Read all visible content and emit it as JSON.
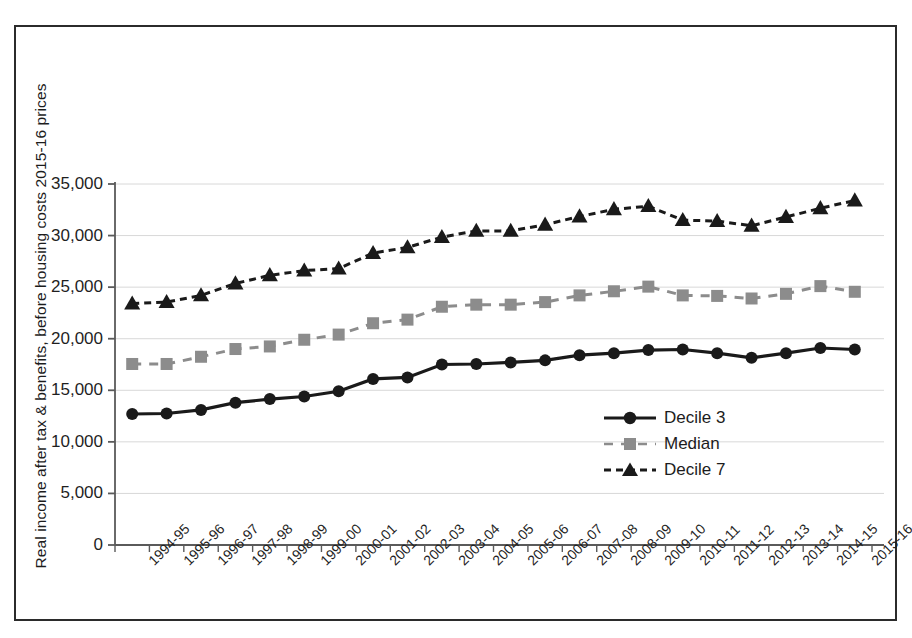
{
  "chart_data": {
    "type": "line",
    "title": "",
    "xlabel": "",
    "ylabel": "Real income after tax & benefits, before housing costs 2015-16 prices",
    "ylim": [
      0,
      35000
    ],
    "ytick_step": 5000,
    "grid": true,
    "legend_position": "inside-lower-right",
    "categories": [
      "1994-95",
      "1995-96",
      "1996-97",
      "1997-98",
      "1998-99",
      "1999-00",
      "2000-01",
      "2001-02",
      "2002-03",
      "2003-04",
      "2004-05",
      "2005-06",
      "2006-07",
      "2007-08",
      "2008-09",
      "2009-10",
      "2010-11",
      "2011-12",
      "2012-13",
      "2013-14",
      "2014-15",
      "2015-16"
    ],
    "ytick_labels": [
      "0",
      "5,000",
      "10,000",
      "15,000",
      "20,000",
      "25,000",
      "30,000",
      "35,000"
    ],
    "ytick_values": [
      0,
      5000,
      10000,
      15000,
      20000,
      25000,
      30000,
      35000
    ],
    "series": [
      {
        "name": "Decile 3",
        "marker": "circle",
        "line_style": "solid",
        "color": "#1a1a1a",
        "values": [
          12700,
          12750,
          13100,
          13800,
          14150,
          14400,
          14900,
          16100,
          16250,
          17500,
          17550,
          17700,
          17900,
          18400,
          18600,
          18900,
          18950,
          18600,
          18150,
          18600,
          19100,
          18950
        ]
      },
      {
        "name": "Median",
        "marker": "square",
        "line_style": "dashed",
        "color": "#8c8c8c",
        "values": [
          17550,
          17550,
          18250,
          19000,
          19250,
          19900,
          20400,
          21500,
          21850,
          23100,
          23300,
          23300,
          23550,
          24200,
          24600,
          25050,
          24200,
          24150,
          23900,
          24350,
          25100,
          24550
        ]
      },
      {
        "name": "Decile 7",
        "marker": "triangle",
        "line_style": "dashed",
        "color": "#1a1a1a",
        "values": [
          23400,
          23550,
          24200,
          25350,
          26150,
          26600,
          26800,
          28300,
          28850,
          29850,
          30450,
          30450,
          31050,
          31850,
          32550,
          32850,
          31500,
          31400,
          30950,
          31800,
          32650,
          33400
        ]
      }
    ]
  },
  "legend": {
    "items": [
      {
        "label": "Decile 3"
      },
      {
        "label": "Median"
      },
      {
        "label": "Decile 7"
      }
    ]
  },
  "colors": {
    "decile3": "#1a1a1a",
    "median": "#8c8c8c",
    "decile7": "#1a1a1a",
    "axis": "#5a5a5a",
    "grid": "#d8d8d8",
    "frame": "#2b2b2b"
  }
}
